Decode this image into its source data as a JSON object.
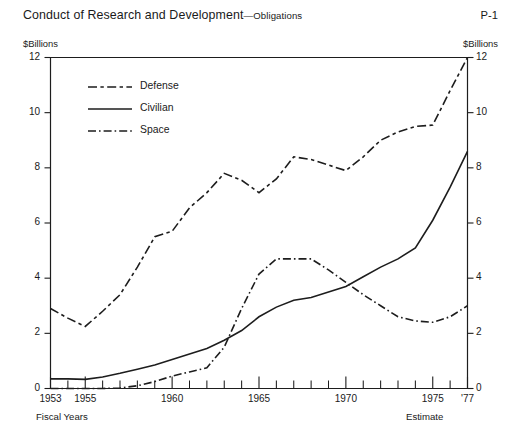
{
  "header": {
    "title_main": "Conduct of Research and Development",
    "title_dash": "—",
    "title_sub": "Obligations",
    "page_code": "P-1"
  },
  "axis": {
    "unit_left": "$Billions",
    "unit_right": "$Billions",
    "x_note_left": "Fiscal Years",
    "x_note_right": "Estimate"
  },
  "legend": {
    "items": [
      {
        "label": "Defense",
        "style": "dashed"
      },
      {
        "label": "Civilian",
        "style": "solid"
      },
      {
        "label": "Space",
        "style": "dash-dot"
      }
    ]
  },
  "chart_data": {
    "type": "line",
    "title": "Conduct of Research and Development—Obligations",
    "xlabel": "Fiscal Years",
    "ylabel": "$Billions",
    "ylim": [
      0,
      12
    ],
    "yticks": [
      0,
      2,
      4,
      6,
      8,
      10,
      12
    ],
    "ytick_labels": [
      "0",
      "2",
      "4",
      "6",
      "8",
      "10",
      "12"
    ],
    "xlim": [
      1953,
      1977
    ],
    "xticks": [
      1953,
      1954,
      1955,
      1956,
      1957,
      1958,
      1959,
      1960,
      1961,
      1962,
      1963,
      1964,
      1965,
      1966,
      1967,
      1968,
      1969,
      1970,
      1971,
      1972,
      1973,
      1974,
      1975,
      1976,
      1977
    ],
    "xtick_labeled": [
      {
        "x": 1953,
        "label": "1953"
      },
      {
        "x": 1955,
        "label": "1955"
      },
      {
        "x": 1960,
        "label": "1960"
      },
      {
        "x": 1965,
        "label": "1965"
      },
      {
        "x": 1970,
        "label": "1970"
      },
      {
        "x": 1975,
        "label": "1975"
      },
      {
        "x": 1977,
        "label": "'77"
      }
    ],
    "grid": false,
    "legend_position": "upper-left-inside",
    "x": [
      1953,
      1954,
      1955,
      1956,
      1957,
      1958,
      1959,
      1960,
      1961,
      1962,
      1963,
      1964,
      1965,
      1966,
      1967,
      1968,
      1969,
      1970,
      1971,
      1972,
      1973,
      1974,
      1975,
      1976,
      1977
    ],
    "series": [
      {
        "name": "Defense",
        "style": "dashed",
        "values": [
          2.9,
          2.55,
          2.25,
          2.8,
          3.4,
          4.4,
          5.5,
          5.7,
          6.55,
          7.1,
          7.8,
          7.55,
          7.1,
          7.6,
          8.4,
          8.3,
          8.1,
          7.9,
          8.4,
          9.0,
          9.3,
          9.5,
          9.55,
          10.8,
          12.0
        ]
      },
      {
        "name": "Civilian",
        "style": "solid",
        "values": [
          0.35,
          0.35,
          0.33,
          0.42,
          0.55,
          0.7,
          0.85,
          1.05,
          1.25,
          1.45,
          1.75,
          2.1,
          2.6,
          2.95,
          3.2,
          3.3,
          3.5,
          3.7,
          4.05,
          4.4,
          4.7,
          5.1,
          6.1,
          7.3,
          8.6
        ]
      },
      {
        "name": "Space",
        "style": "dash-dot",
        "values": [
          0.0,
          0.0,
          0.0,
          0.0,
          0.02,
          0.1,
          0.25,
          0.45,
          0.6,
          0.75,
          1.5,
          2.9,
          4.15,
          4.7,
          4.7,
          4.7,
          4.3,
          3.85,
          3.4,
          3.0,
          2.6,
          2.45,
          2.4,
          2.6,
          3.0
        ]
      }
    ]
  }
}
